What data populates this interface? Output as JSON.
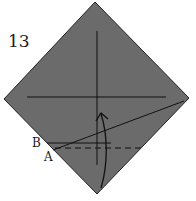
{
  "diagram": {
    "step_number": "13",
    "labels": {
      "point_b": "B",
      "point_a": "A"
    },
    "colors": {
      "paper_fill": "#6b6b6b",
      "line": "#111111",
      "background": "#ffffff"
    },
    "shapes": {
      "paper_square": "diamond (square rotated 45°)",
      "crease_horizontal": "solid horizontal crease through center",
      "crease_vertical": "solid vertical crease through center",
      "fold_line_diagonal": "solid line from point A to right corner",
      "line_b": "short solid horizontal line at B",
      "valley_fold_line": "dashed horizontal line at A",
      "fold_arrow": "curved arrow pointing upward from bottom corner"
    }
  }
}
